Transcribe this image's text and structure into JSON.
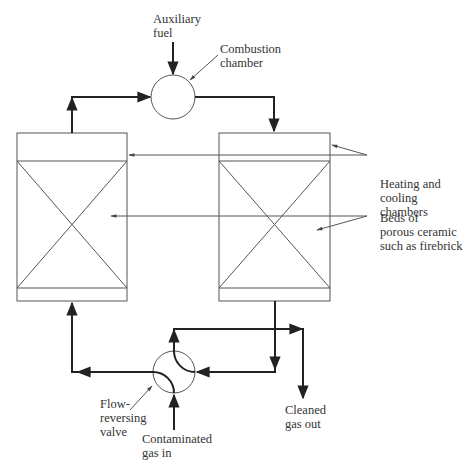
{
  "diagram": {
    "labels": {
      "auxiliary_fuel": [
        "Auxiliary",
        "fuel"
      ],
      "combustion_chamber": [
        "Combustion",
        "chamber"
      ],
      "heating_cooling": [
        "Heating and",
        "cooling",
        "chambers"
      ],
      "beds": [
        "Beds of",
        "porous ceramic",
        "such as firebrick"
      ],
      "valve": [
        "Flow-",
        "reversing",
        "valve"
      ],
      "contaminated": [
        "Contaminated",
        "gas in"
      ],
      "cleaned": [
        "Cleaned",
        "gas out"
      ]
    },
    "nodes": [
      {
        "id": "combustion-chamber",
        "shape": "circle"
      },
      {
        "id": "left-regenerator",
        "shape": "box"
      },
      {
        "id": "right-regenerator",
        "shape": "box"
      },
      {
        "id": "flow-reversing-valve",
        "shape": "circle"
      }
    ],
    "colors": {
      "line": "#222222",
      "text": "#333333"
    }
  }
}
